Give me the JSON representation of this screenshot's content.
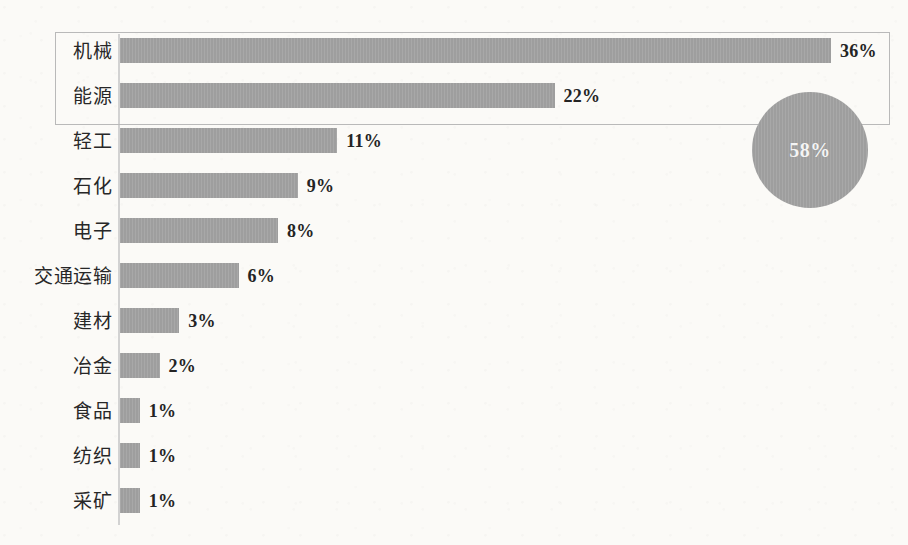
{
  "chart_data": {
    "type": "bar",
    "orientation": "horizontal",
    "title": "",
    "subtitle": "",
    "xlabel": "",
    "ylabel": "",
    "grid": false,
    "legend": null,
    "xlim": [
      0,
      40
    ],
    "value_suffix": "%",
    "categories": [
      "机械",
      "能源",
      "轻工",
      "石化",
      "电子",
      "交通运输",
      "建材",
      "冶金",
      "食品",
      "纺织",
      "采矿"
    ],
    "values": [
      36,
      22,
      11,
      9,
      8,
      6,
      3,
      2,
      1,
      1,
      1
    ],
    "value_labels": [
      "36%",
      "22%",
      "11%",
      "9%",
      "8%",
      "6%",
      "3%",
      "2%",
      "1%",
      "1%",
      "1%"
    ],
    "annotations": [
      {
        "name": "top-two-highlight",
        "kind": "rectangle",
        "covers": [
          "机械",
          "能源"
        ],
        "label": ""
      },
      {
        "name": "sum-bubble",
        "kind": "circle",
        "label": "58%",
        "covers": [
          "机械",
          "能源"
        ]
      }
    ],
    "colors": {
      "bar": "#a3a3a3",
      "bubble": "#a3a3a3",
      "bubble_text": "#f4f4f4",
      "axis": "#d2d2d2",
      "box_border": "#b9b9b9",
      "text": "#272727",
      "background": "#fbfaf7"
    }
  }
}
